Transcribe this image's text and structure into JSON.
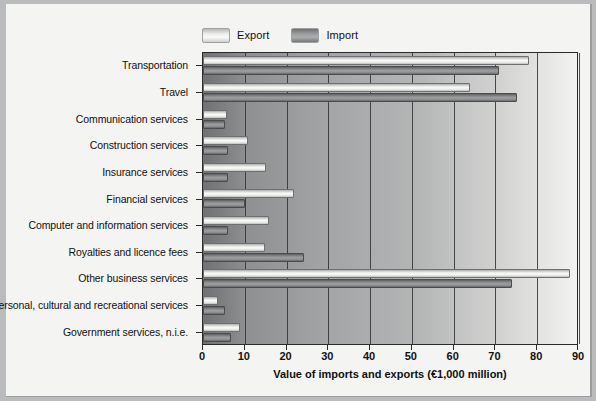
{
  "chart_data": {
    "type": "bar",
    "orientation": "horizontal",
    "title": "",
    "xlabel": "Value of imports and exports (€1,000 million)",
    "ylabel": "",
    "xlim": [
      0,
      90
    ],
    "xticks": [
      0,
      10,
      20,
      30,
      40,
      50,
      60,
      70,
      80,
      90
    ],
    "grid": "vertical",
    "legend_position": "top-left",
    "categories": [
      "Transportation",
      "Travel",
      "Communication services",
      "Construction services",
      "Insurance services",
      "Financial services",
      "Computer and information services",
      "Royalties and licence fees",
      "Other business services",
      "Personal, cultural and recreational services",
      "Government services, n.i.e."
    ],
    "series": [
      {
        "name": "Export",
        "color": "#fbfbfa",
        "values": [
          78.0,
          64.0,
          5.7,
          10.7,
          15.1,
          21.9,
          15.9,
          14.9,
          87.9,
          3.5,
          8.9
        ]
      },
      {
        "name": "Import",
        "color": "#9a9c9e",
        "values": [
          70.8,
          75.2,
          5.3,
          5.9,
          5.9,
          10.1,
          6.1,
          24.1,
          74.0,
          5.3,
          6.7
        ]
      }
    ]
  },
  "legend": {
    "entries": [
      {
        "label": "Export",
        "swatch": "export-swatch"
      },
      {
        "label": "Import",
        "swatch": "import-swatch"
      }
    ]
  }
}
